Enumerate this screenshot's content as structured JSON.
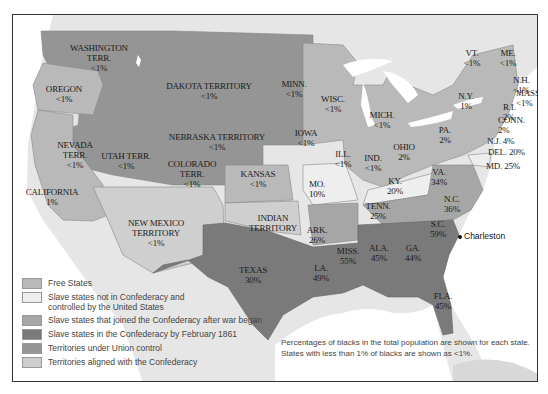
{
  "colors": {
    "free": "#b9b9b9",
    "border_slave": "#eeeeee",
    "joined_after": "#a6a6a6",
    "confederacy_feb1861": "#7a7a7a",
    "union_territory": "#959595",
    "confederate_territory": "#cfcfcf",
    "foreign": "#e6e6e6",
    "water": "#ffffff"
  },
  "regions": [
    {
      "name": "WASHINGTON TERR.",
      "lines": [
        "WASHINGTON",
        "TERR.",
        "<1%"
      ],
      "x": 98,
      "y": 42
    },
    {
      "name": "OREGON",
      "lines": [
        "OREGON",
        "<1%"
      ],
      "x": 63,
      "y": 83
    },
    {
      "name": "DAKOTA TERRITORY",
      "lines": [
        "DAKOTA TERRITORY",
        "<1%"
      ],
      "x": 208,
      "y": 80
    },
    {
      "name": "MINN.",
      "lines": [
        "MINN.",
        "<1%"
      ],
      "x": 293,
      "y": 78
    },
    {
      "name": "WISC.",
      "lines": [
        "WISC.",
        "<1%"
      ],
      "x": 332,
      "y": 93
    },
    {
      "name": "MICH.",
      "lines": [
        "MICH.",
        "<1%"
      ],
      "x": 381,
      "y": 109
    },
    {
      "name": "VT.",
      "lines": [
        "VT.",
        "<1%"
      ],
      "x": 471,
      "y": 47
    },
    {
      "name": "ME.",
      "lines": [
        "ME.",
        "<1%"
      ],
      "x": 507,
      "y": 47
    },
    {
      "name": "N.Y.",
      "lines": [
        "N.Y.",
        "1%"
      ],
      "x": 465,
      "y": 90
    },
    {
      "name": "NEBRASKA TERRITORY",
      "lines": [
        "NEBRASKA TERRITORY",
        "<1%"
      ],
      "x": 216,
      "y": 131
    },
    {
      "name": "IOWA",
      "lines": [
        "IOWA",
        "<1%"
      ],
      "x": 305,
      "y": 127
    },
    {
      "name": "NEVADA TERR.",
      "lines": [
        "NEVADA",
        "TERR.",
        "<1%"
      ],
      "x": 74,
      "y": 139
    },
    {
      "name": "UTAH TERR.",
      "lines": [
        "UTAH TERR.",
        "<1%"
      ],
      "x": 125,
      "y": 150
    },
    {
      "name": "COLORADO TERR.",
      "lines": [
        "COLORADO",
        "TERR.",
        "<1%"
      ],
      "x": 191,
      "y": 158
    },
    {
      "name": "KANSAS",
      "lines": [
        "KANSAS",
        "<1%"
      ],
      "x": 257,
      "y": 168
    },
    {
      "name": "ILL.",
      "lines": [
        "ILL.",
        "<1%"
      ],
      "x": 342,
      "y": 148
    },
    {
      "name": "IND.",
      "lines": [
        "IND.",
        "<1%"
      ],
      "x": 372,
      "y": 152
    },
    {
      "name": "OHIO",
      "lines": [
        "OHIO",
        "2%"
      ],
      "x": 403,
      "y": 141
    },
    {
      "name": "PA.",
      "lines": [
        "PA.",
        "2%"
      ],
      "x": 444,
      "y": 124
    },
    {
      "name": "MO.",
      "lines": [
        "MO.",
        "10%"
      ],
      "x": 316,
      "y": 178
    },
    {
      "name": "KY.",
      "lines": [
        "KY.",
        "20%"
      ],
      "x": 394,
      "y": 175
    },
    {
      "name": "VA.",
      "lines": [
        "VA.",
        "34%"
      ],
      "x": 438,
      "y": 166
    },
    {
      "name": "CALIFORNIA",
      "lines": [
        "CALIFORNIA",
        "1%"
      ],
      "x": 51,
      "y": 186
    },
    {
      "name": "NEW MEXICO TERRITORY",
      "lines": [
        "NEW MEXICO",
        "TERRITORY",
        "<1%"
      ],
      "x": 155,
      "y": 217
    },
    {
      "name": "INDIAN TERRITORY",
      "lines": [
        "INDIAN",
        "TERRITORY"
      ],
      "x": 272,
      "y": 212
    },
    {
      "name": "ARK.",
      "lines": [
        "ARK.",
        "26%"
      ],
      "x": 316,
      "y": 224
    },
    {
      "name": "TENN.",
      "lines": [
        "TENN.",
        "25%"
      ],
      "x": 377,
      "y": 200
    },
    {
      "name": "N.C.",
      "lines": [
        "N.C.",
        "36%"
      ],
      "x": 451,
      "y": 193
    },
    {
      "name": "S.C.",
      "lines": [
        "S.C.",
        "59%"
      ],
      "x": 437,
      "y": 218
    },
    {
      "name": "MISS.",
      "lines": [
        "MISS.",
        "55%"
      ],
      "x": 347,
      "y": 245
    },
    {
      "name": "ALA.",
      "lines": [
        "ALA.",
        "45%"
      ],
      "x": 378,
      "y": 242
    },
    {
      "name": "GA.",
      "lines": [
        "GA.",
        "44%"
      ],
      "x": 412,
      "y": 242
    },
    {
      "name": "TEXAS",
      "lines": [
        "TEXAS",
        "30%"
      ],
      "x": 252,
      "y": 264
    },
    {
      "name": "LA.",
      "lines": [
        "LA.",
        "49%"
      ],
      "x": 320,
      "y": 262
    },
    {
      "name": "FLA.",
      "lines": [
        "FLA.",
        "45%"
      ],
      "x": 442,
      "y": 290
    }
  ],
  "small_labels": [
    {
      "name": "N.H.",
      "lines": [
        "N.H.",
        "<1%"
      ],
      "x": 512,
      "y": 74
    },
    {
      "name": "MASS.",
      "lines": [
        "MASS.",
        "<1%"
      ],
      "x": 515,
      "y": 87
    },
    {
      "name": "R.I.",
      "lines": [
        "R.I.",
        "2%"
      ],
      "x": 502,
      "y": 101
    },
    {
      "name": "CONN.",
      "lines": [
        "CONN.",
        "2%"
      ],
      "x": 497,
      "y": 114
    },
    {
      "name": "N.J.",
      "lines": [
        "N.J. 4%"
      ],
      "x": 486,
      "y": 135
    },
    {
      "name": "DEL.",
      "lines": [
        "DEL. 20%"
      ],
      "x": 487,
      "y": 146
    },
    {
      "name": "MD.",
      "lines": [
        "MD. 25%"
      ],
      "x": 485,
      "y": 160
    }
  ],
  "city": {
    "name": "Charleston",
    "x": 451,
    "y": 233
  },
  "legend": [
    {
      "label": "Free States",
      "color_key": "free"
    },
    {
      "label": "Slave states not in Confederacy and controlled by the United States",
      "line1": "Slave states not in Confederacy and",
      "line2": "controlled by the United States",
      "color_key": "border_slave"
    },
    {
      "label": "Slave states that joined the Confederacy after war began",
      "color_key": "joined_after"
    },
    {
      "label": "Slave states in the Confederacy by February 1861",
      "color_key": "confederacy_feb1861"
    },
    {
      "label": "Territories under Union control",
      "color_key": "union_territory"
    },
    {
      "label": "Territories aligned with the Confederacy",
      "color_key": "confederate_territory"
    }
  ],
  "note": {
    "line1": "Percentages of blacks in the total population are shown for each state.",
    "line2": "States with less than 1% of blacks are shown as <1%."
  }
}
